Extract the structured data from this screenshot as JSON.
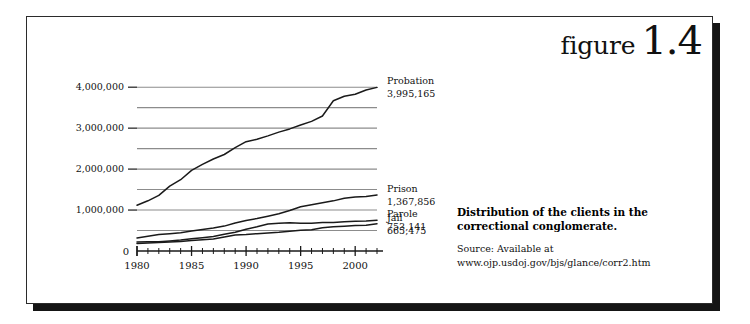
{
  "figure": {
    "word": "figure",
    "number": "1.4"
  },
  "caption": {
    "title": "Distribution of the clients in the correctional conglomerate.",
    "source_label": "Source: Available at",
    "source_url": "www.ojp.usdoj.gov/bjs/glance/corr2.htm"
  },
  "colors": {
    "line": "#1a1a1a",
    "grid": "#8c8c8c",
    "axis": "#1a1a1a",
    "frame": "#2b2b2b",
    "shadow": "#151515",
    "background": "#ffffff"
  },
  "chart_data": {
    "type": "line",
    "title": "",
    "xlabel": "",
    "ylabel": "",
    "xlim": [
      1980,
      2002
    ],
    "ylim": [
      0,
      4200000
    ],
    "y_ticks_labeled": [
      {
        "value": 1000000,
        "label": "1,000,000"
      },
      {
        "value": 2000000,
        "label": "2,000,000"
      },
      {
        "value": 3000000,
        "label": "3,000,000"
      },
      {
        "value": 4000000,
        "label": "4,000,000"
      }
    ],
    "y_origin_label": "0",
    "gridlines": [
      500000,
      1000000,
      1500000,
      2000000,
      2500000,
      3000000,
      3500000,
      4000000
    ],
    "grid": true,
    "legend_position": "right-inline-end-labels",
    "x_ticks_major": [
      1980,
      1985,
      1990,
      1995,
      2000
    ],
    "x_tick_labels": [
      "1980",
      "1985",
      "1990",
      "1995",
      "2000"
    ],
    "x_ticks_minor_step": 1,
    "x": [
      1980,
      1981,
      1982,
      1983,
      1984,
      1985,
      1986,
      1987,
      1988,
      1989,
      1990,
      1991,
      1992,
      1993,
      1994,
      1995,
      1996,
      1997,
      1998,
      1999,
      2000,
      2001,
      2002
    ],
    "series": [
      {
        "name": "Probation",
        "end_label": "Probation",
        "end_value_label": "3,995,165",
        "end_value": 3995165,
        "values": [
          1118097,
          1225934,
          1357264,
          1582947,
          1740948,
          1968712,
          2114621,
          2247158,
          2356483,
          2522125,
          2670234,
          2728472,
          2811611,
          2903061,
          2981022,
          3077861,
          3164996,
          3296513,
          3670441,
          3779922,
          3826209,
          3931731,
          3995165
        ]
      },
      {
        "name": "Prison",
        "end_label": "Prison",
        "end_value_label": "1,367,856",
        "end_value": 1367856,
        "values": [
          319598,
          360029,
          402914,
          423898,
          448264,
          487593,
          526436,
          562814,
          607766,
          683367,
          743382,
          792535,
          850566,
          909381,
          990147,
          1078542,
          1127528,
          1176564,
          1224469,
          1287172,
          1316333,
          1330007,
          1367856
        ]
      },
      {
        "name": "Parole",
        "end_label": "Parole",
        "end_value_label": "753,141",
        "end_value": 753141,
        "values": [
          220438,
          225539,
          224604,
          246440,
          266992,
          300203,
          325638,
          355505,
          407977,
          456803,
          531407,
          590442,
          658601,
          676100,
          690371,
          679421,
          679733,
          694787,
          696385,
          714457,
          723898,
          732333,
          753141
        ]
      },
      {
        "name": "Jail",
        "end_label": "Jail",
        "end_value_label": "665,475",
        "end_value": 665475,
        "values": [
          182288,
          195085,
          207853,
          221815,
          233018,
          254986,
          272736,
          294092,
          341893,
          393303,
          405320,
          424129,
          441781,
          455500,
          479800,
          507044,
          518492,
          567079,
          592462,
          605943,
          621149,
          631240,
          665475
        ]
      }
    ]
  }
}
